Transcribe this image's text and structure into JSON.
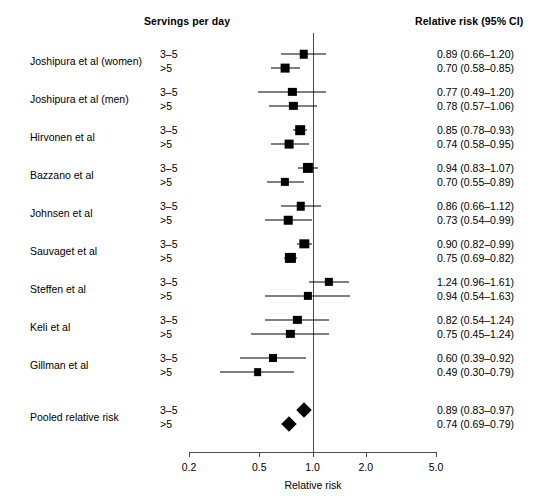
{
  "headers": {
    "servings": "Servings per day",
    "relative_risk": "Relative risk (95% CI)"
  },
  "axis": {
    "title": "Relative risk",
    "ticks": [
      "0.2",
      "0.5",
      "1.0",
      "2.0",
      "5.0"
    ],
    "tick_values": [
      0.2,
      0.5,
      1.0,
      2.0,
      5.0
    ],
    "scale": "log",
    "reference_line": 1.0
  },
  "dose_labels": [
    "3–5",
    ">5"
  ],
  "chart_data": {
    "type": "forest",
    "title": "",
    "xlabel": "Relative risk",
    "ylabel": "",
    "xscale": "log",
    "xlim": [
      0.2,
      5.0
    ],
    "xticks": [
      0.2,
      0.5,
      1.0,
      2.0,
      5.0
    ],
    "reference_line": 1.0,
    "effect_measure": "Relative risk (95% CI)",
    "subgroup_label": "Servings per day",
    "studies": [
      {
        "name": "Joshipura et al (women)",
        "rows": [
          {
            "dose": "3–5",
            "estimate": 0.89,
            "ci_low": 0.66,
            "ci_high": 1.2,
            "text": "0.89 (0.66–1.20)",
            "marker": "box",
            "weight": 0.55
          },
          {
            "dose": ">5",
            "estimate": 0.7,
            "ci_low": 0.58,
            "ci_high": 0.85,
            "text": "0.70 (0.58–0.85)",
            "marker": "box",
            "weight": 0.6
          }
        ]
      },
      {
        "name": "Joshipura et al (men)",
        "rows": [
          {
            "dose": "3–5",
            "estimate": 0.77,
            "ci_low": 0.49,
            "ci_high": 1.2,
            "text": "0.77 (0.49–1.20)",
            "marker": "box",
            "weight": 0.5
          },
          {
            "dose": ">5",
            "estimate": 0.78,
            "ci_low": 0.57,
            "ci_high": 1.06,
            "text": "0.78 (0.57–1.06)",
            "marker": "box",
            "weight": 0.5
          }
        ]
      },
      {
        "name": "Hirvonen et al",
        "rows": [
          {
            "dose": "3–5",
            "estimate": 0.85,
            "ci_low": 0.78,
            "ci_high": 0.93,
            "text": "0.85 (0.78–0.93)",
            "marker": "box",
            "weight": 0.75
          },
          {
            "dose": ">5",
            "estimate": 0.74,
            "ci_low": 0.58,
            "ci_high": 0.95,
            "text": "0.74 (0.58–0.95)",
            "marker": "box",
            "weight": 0.6
          }
        ]
      },
      {
        "name": "Bazzano et al",
        "rows": [
          {
            "dose": "3–5",
            "estimate": 0.94,
            "ci_low": 0.83,
            "ci_high": 1.07,
            "text": "0.94 (0.83–1.07)",
            "marker": "box",
            "weight": 0.85
          },
          {
            "dose": ">5",
            "estimate": 0.7,
            "ci_low": 0.55,
            "ci_high": 0.89,
            "text": "0.70 (0.55–0.89)",
            "marker": "box",
            "weight": 0.5
          }
        ]
      },
      {
        "name": "Johnsen et al",
        "rows": [
          {
            "dose": "3–5",
            "estimate": 0.86,
            "ci_low": 0.66,
            "ci_high": 1.12,
            "text": "0.86 (0.66–1.12)",
            "marker": "box",
            "weight": 0.55
          },
          {
            "dose": ">5",
            "estimate": 0.73,
            "ci_low": 0.54,
            "ci_high": 0.99,
            "text": "0.73 (0.54–0.99)",
            "marker": "box",
            "weight": 0.55
          }
        ]
      },
      {
        "name": "Sauvaget et al",
        "rows": [
          {
            "dose": "3–5",
            "estimate": 0.9,
            "ci_low": 0.82,
            "ci_high": 0.99,
            "text": "0.90 (0.82–0.99)",
            "marker": "box",
            "weight": 0.7
          },
          {
            "dose": ">5",
            "estimate": 0.75,
            "ci_low": 0.69,
            "ci_high": 0.82,
            "text": "0.75 (0.69–0.82)",
            "marker": "box",
            "weight": 0.85
          }
        ]
      },
      {
        "name": "Steffen et al",
        "rows": [
          {
            "dose": "3–5",
            "estimate": 1.24,
            "ci_low": 0.96,
            "ci_high": 1.61,
            "text": "1.24 (0.96–1.61)",
            "marker": "box",
            "weight": 0.5
          },
          {
            "dose": ">5",
            "estimate": 0.94,
            "ci_low": 0.54,
            "ci_high": 1.63,
            "text": "0.94 (0.54–1.63)",
            "marker": "box",
            "weight": 0.5
          }
        ]
      },
      {
        "name": "Keli et al",
        "rows": [
          {
            "dose": "3–5",
            "estimate": 0.82,
            "ci_low": 0.54,
            "ci_high": 1.24,
            "text": "0.82 (0.54–1.24)",
            "marker": "box",
            "weight": 0.5
          },
          {
            "dose": ">5",
            "estimate": 0.75,
            "ci_low": 0.45,
            "ci_high": 1.24,
            "text": "0.75 (0.45–1.24)",
            "marker": "box",
            "weight": 0.5
          }
        ]
      },
      {
        "name": "Gillman et al",
        "rows": [
          {
            "dose": "3–5",
            "estimate": 0.6,
            "ci_low": 0.39,
            "ci_high": 0.92,
            "text": "0.60 (0.39–0.92)",
            "marker": "box",
            "weight": 0.45
          },
          {
            "dose": ">5",
            "estimate": 0.49,
            "ci_low": 0.3,
            "ci_high": 0.79,
            "text": "0.49 (0.30–0.79)",
            "marker": "box",
            "weight": 0.4
          }
        ]
      },
      {
        "name": "Pooled relative risk",
        "pooled": true,
        "rows": [
          {
            "dose": "3–5",
            "estimate": 0.89,
            "ci_low": 0.83,
            "ci_high": 0.97,
            "text": "0.89 (0.83–0.97)",
            "marker": "diamond"
          },
          {
            "dose": ">5",
            "estimate": 0.74,
            "ci_low": 0.69,
            "ci_high": 0.79,
            "text": "0.74 (0.69–0.79)",
            "marker": "diamond"
          }
        ]
      }
    ]
  }
}
